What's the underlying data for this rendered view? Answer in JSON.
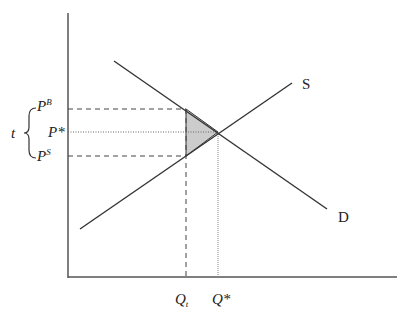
{
  "diagram": {
    "curves": {
      "supply": {
        "label": "S"
      },
      "demand": {
        "label": "D"
      }
    },
    "price_labels": {
      "buyer_price": "P",
      "buyer_price_sup": "B",
      "equilibrium_price": "P*",
      "seller_price": "P",
      "seller_price_sup": "S",
      "tax": "t"
    },
    "quantity_labels": {
      "taxed_quantity": "Q",
      "taxed_quantity_sub": "t",
      "equilibrium_quantity": "Q*"
    },
    "colors": {
      "axis": "#555555",
      "curve": "#333333",
      "deadweight_fill": "#cccccc",
      "guide": "#444444"
    }
  }
}
